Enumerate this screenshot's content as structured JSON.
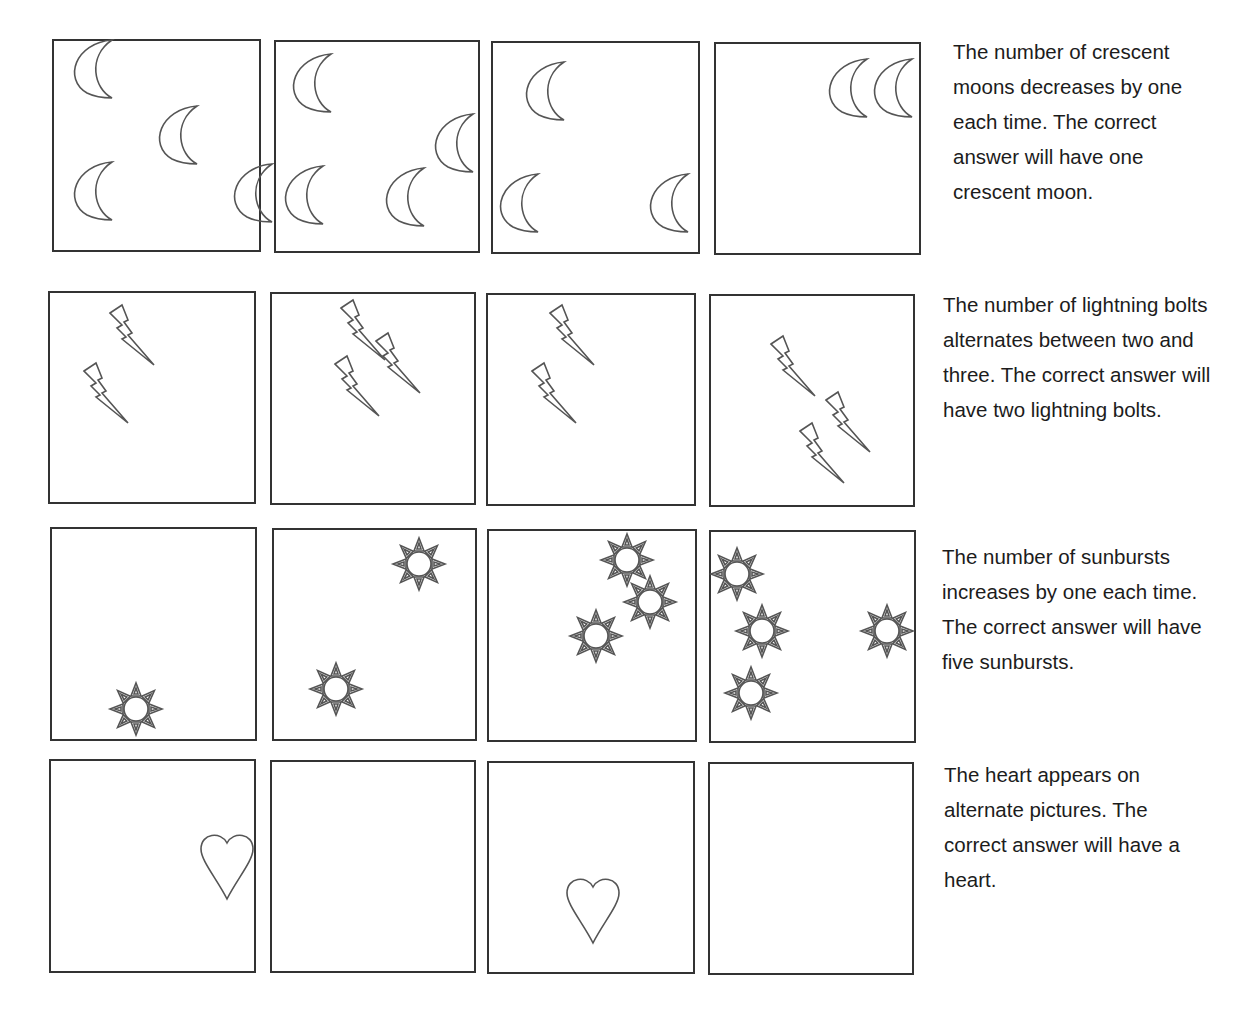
{
  "header": {
    "text": ""
  },
  "rows": [
    {
      "id": "crescent-moons",
      "symbol": "crescent-moon",
      "counts": [
        4,
        4,
        3,
        2
      ],
      "answer_count": 1,
      "explanation": "The number of crescent moons decreases by one each time. The correct answer will have one crescent moon."
    },
    {
      "id": "lightning-bolts",
      "symbol": "lightning-bolt",
      "counts": [
        2,
        3,
        2,
        3
      ],
      "answer_count": 2,
      "explanation": "The number of lightning bolts alternates between two and three. The correct answer will have two lightning bolts."
    },
    {
      "id": "sunbursts",
      "symbol": "sunburst",
      "counts": [
        1,
        2,
        3,
        4
      ],
      "answer_count": 5,
      "explanation": "The number of sunbursts increases by one each time. The correct answer will have five sunbursts."
    },
    {
      "id": "hearts",
      "symbol": "heart",
      "counts": [
        1,
        0,
        1,
        0
      ],
      "answer_count": 1,
      "explanation": "The heart appears on alternate pictures. The correct answer will have a heart."
    }
  ]
}
